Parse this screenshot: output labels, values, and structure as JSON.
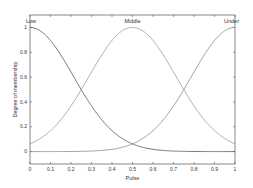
{
  "chart_data": {
    "type": "line",
    "title": "",
    "xlabel": "Pulse",
    "ylabel": "Degree of membership",
    "xlim": [
      0,
      1
    ],
    "ylim": [
      -0.1,
      1.1
    ],
    "grid": false,
    "legend_position": "inline labels at curve peaks",
    "x_ticks": [
      "0",
      "0.1",
      "0.2",
      "0.3",
      "0.4",
      "0.5",
      "0.6",
      "0.7",
      "0.8",
      "0.9",
      "1"
    ],
    "y_ticks": [
      "0",
      "0.2",
      "0.4",
      "0.6",
      "0.8",
      "1"
    ],
    "series": [
      {
        "name": "Low",
        "shape": "gaussian",
        "center": 0.0,
        "sigma": 0.212,
        "color": "#555555",
        "x": [
          0,
          0.1,
          0.2,
          0.25,
          0.3,
          0.4,
          0.5,
          0.6,
          0.7,
          0.8,
          0.9,
          1
        ],
        "values": [
          1.0,
          0.89,
          0.64,
          0.5,
          0.37,
          0.17,
          0.06,
          0.02,
          0.004,
          0.001,
          0.0,
          0.0
        ]
      },
      {
        "name": "Middle",
        "shape": "gaussian",
        "center": 0.5,
        "sigma": 0.212,
        "color": "#999999",
        "x": [
          0,
          0.1,
          0.2,
          0.25,
          0.3,
          0.4,
          0.5,
          0.6,
          0.7,
          0.8,
          0.9,
          1
        ],
        "values": [
          0.06,
          0.17,
          0.37,
          0.5,
          0.64,
          0.89,
          1.0,
          0.89,
          0.64,
          0.37,
          0.17,
          0.06
        ]
      },
      {
        "name": "Under",
        "shape": "gaussian",
        "center": 1.0,
        "sigma": 0.212,
        "color": "#888888",
        "x": [
          0,
          0.1,
          0.2,
          0.3,
          0.4,
          0.5,
          0.6,
          0.7,
          0.75,
          0.8,
          0.9,
          1
        ],
        "values": [
          0.0,
          0.0,
          0.001,
          0.004,
          0.02,
          0.06,
          0.17,
          0.37,
          0.5,
          0.64,
          0.89,
          1.0
        ]
      }
    ]
  }
}
